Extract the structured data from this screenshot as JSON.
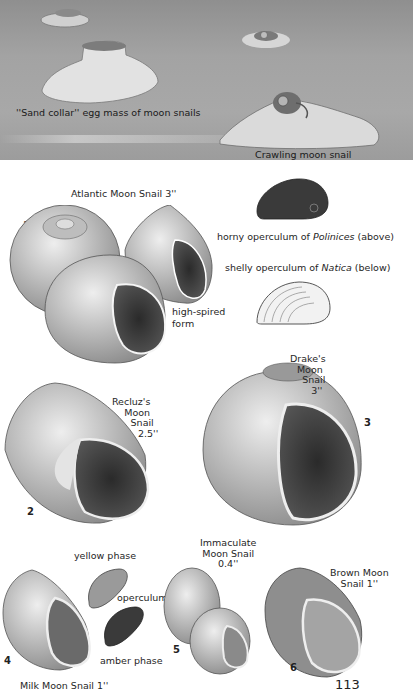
{
  "scene": {
    "caption_egg_mass": "''Sand collar'' egg mass of moon snails",
    "caption_crawling": "Crawling moon snail"
  },
  "plates": [
    {
      "number": "1",
      "name": "Atlantic Moon Snail 3''",
      "note": "high-spired form"
    },
    {
      "number": "2",
      "name_lines": [
        "Recluz's",
        "Moon",
        "Snail",
        "2.5''"
      ]
    },
    {
      "number": "3",
      "name_lines": [
        "Drake's",
        "Moon",
        "Snail",
        "3''"
      ]
    },
    {
      "number": "4",
      "name": "Milk Moon Snail 1''",
      "notes": [
        "yellow phase",
        "operculum",
        "amber phase"
      ]
    },
    {
      "number": "5",
      "name_lines": [
        "Immaculate",
        "Moon Snail",
        "0.4''"
      ]
    },
    {
      "number": "6",
      "name_lines": [
        "Brown Moon",
        "Snail 1''"
      ]
    }
  ],
  "operculum_captions": {
    "horny_prefix": "horny operculum of ",
    "horny_genus": "Polinices",
    "horny_suffix": " (above)",
    "shelly_prefix": "shelly operculum of ",
    "shelly_genus": "Natica",
    "shelly_suffix": " (below)"
  },
  "page_number": "113"
}
